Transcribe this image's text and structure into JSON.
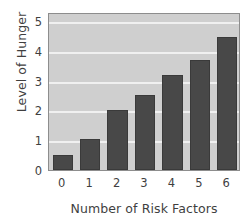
{
  "chart_data": {
    "type": "bar",
    "title": "",
    "xlabel": "Number of Risk Factors",
    "ylabel": "Level of Hunger",
    "categories": [
      "0",
      "1",
      "2",
      "3",
      "4",
      "5",
      "6"
    ],
    "values": [
      0.5,
      1.05,
      2.0,
      2.5,
      3.2,
      3.7,
      4.45
    ],
    "ylim": [
      0,
      5.3
    ],
    "yticks": [
      0,
      1,
      2,
      3,
      4,
      5
    ],
    "ytick_labels": [
      "0",
      "1",
      "2",
      "3",
      "4",
      "5"
    ],
    "xtick_labels": [
      "0",
      "1",
      "2",
      "3",
      "4",
      "5",
      "6"
    ],
    "grid": true,
    "grid_axis": "y",
    "legend": false,
    "bar_color": "#484848",
    "plot_background": "#cfcfcf",
    "gridline_color": "#f0f0f0",
    "axis_color": "#8d8d8d",
    "text_color": "#3f3f3f"
  }
}
